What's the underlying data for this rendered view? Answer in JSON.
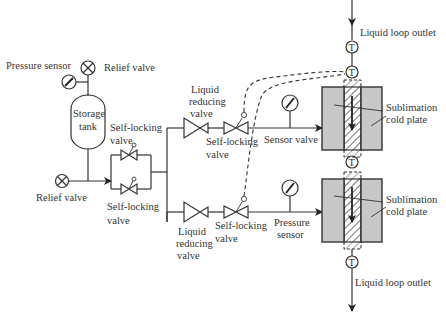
{
  "diagram": {
    "type": "piping-schematic",
    "labels": {
      "pressure_sensor_top": "Pressure sensor",
      "relief_valve_top": "Relief valve",
      "storage_tank_line1": "Storage",
      "storage_tank_line2": "tank",
      "self_locking_upper_line1": "Self-locking",
      "self_locking_upper_line2": "valve",
      "relief_valve_left": "Relief valve",
      "self_locking_lower_line1": "Self-locking",
      "self_locking_lower_line2": "valve",
      "liquid_reducing_top_line1": "Liquid",
      "liquid_reducing_top_line2": "reducing",
      "liquid_reducing_top_line3": "valve",
      "self_locking_branch_top_line1": "Self-locking",
      "self_locking_branch_top_line2": "valve",
      "sensor_valve": "Sensor valve",
      "liquid_reducing_bottom_line1": "Liquid",
      "liquid_reducing_bottom_line2": "reducing",
      "liquid_reducing_bottom_line3": "valve",
      "self_locking_branch_bottom_line1": "Self-locking",
      "self_locking_branch_bottom_line2": "valve",
      "pressure_sensor_bottom_line1": "Pressure",
      "pressure_sensor_bottom_line2": "sensor",
      "liquid_loop_outlet_top": "Liquid loop outlet",
      "liquid_loop_outlet_bottom": "Liquid loop outlet",
      "sublimation_upper_line1": "Sublimation",
      "sublimation_upper_line2": "cold plate",
      "sublimation_lower_line1": "Sublimation",
      "sublimation_lower_line2": "cold plate",
      "temp_sensor_symbol": "T"
    },
    "components": [
      {
        "name": "storage-tank",
        "kind": "tank"
      },
      {
        "name": "pressure-sensor-tank",
        "kind": "gauge"
      },
      {
        "name": "relief-valve-tank",
        "kind": "relief-valve"
      },
      {
        "name": "relief-valve-inlet",
        "kind": "relief-valve"
      },
      {
        "name": "self-locking-valve-parallel-upper",
        "kind": "self-locking-valve"
      },
      {
        "name": "self-locking-valve-parallel-lower",
        "kind": "self-locking-valve"
      },
      {
        "name": "liquid-reducing-valve-branch-1",
        "kind": "reducing-valve"
      },
      {
        "name": "self-locking-valve-branch-1",
        "kind": "self-locking-valve"
      },
      {
        "name": "sensor-valve-gauge-branch-1",
        "kind": "gauge"
      },
      {
        "name": "liquid-reducing-valve-branch-2",
        "kind": "reducing-valve"
      },
      {
        "name": "self-locking-valve-branch-2",
        "kind": "self-locking-valve"
      },
      {
        "name": "pressure-sensor-branch-2",
        "kind": "gauge"
      },
      {
        "name": "sublimation-cold-plate-upper",
        "kind": "cold-plate"
      },
      {
        "name": "sublimation-cold-plate-lower",
        "kind": "cold-plate"
      },
      {
        "name": "temperature-sensors",
        "kind": "T-sensor",
        "count": 4
      }
    ]
  }
}
